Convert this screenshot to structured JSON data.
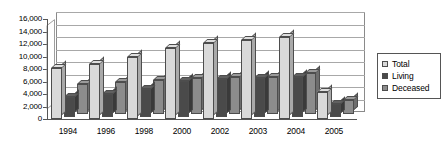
{
  "chart_data": {
    "type": "bar",
    "title": "",
    "subtitle": "",
    "xlabel": "",
    "ylabel": "",
    "categories": [
      "1994",
      "1996",
      "1998",
      "2000",
      "2002",
      "2003",
      "2004",
      "2005"
    ],
    "series": [
      {
        "name": "Total",
        "color": "#d9d9d9",
        "values": [
          8200,
          8800,
          10000,
          11400,
          12200,
          12700,
          13100,
          4300
        ]
      },
      {
        "name": "Living",
        "color": "#4a4a4a",
        "values": [
          3100,
          3700,
          4400,
          5700,
          6100,
          6200,
          6300,
          2000
        ]
      },
      {
        "name": "Deceased",
        "color": "#8c8c8c",
        "values": [
          4900,
          5200,
          5500,
          5800,
          5900,
          6000,
          6600,
          2300
        ]
      }
    ],
    "ylim": [
      0,
      16000
    ],
    "ytick_step": 2000,
    "ytick_labels": [
      "16,000",
      "14,000",
      "12,000",
      "10,000",
      "8,000",
      "6,000",
      "4,000",
      "2,000",
      "0"
    ],
    "ytick_values": [
      16000,
      14000,
      12000,
      10000,
      8000,
      6000,
      4000,
      2000,
      0
    ],
    "grid": true,
    "legend_position": "right",
    "style": "3d-clustered-column"
  },
  "legend": {
    "items": [
      {
        "label": "Total"
      },
      {
        "label": "Living"
      },
      {
        "label": "Deceased"
      }
    ]
  }
}
